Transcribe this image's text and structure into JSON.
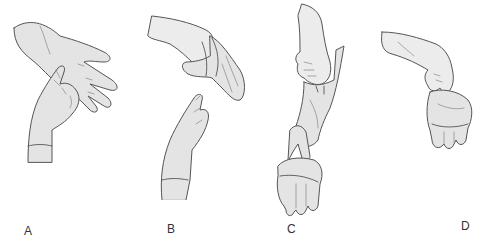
{
  "figure": {
    "panels": [
      {
        "id": "A",
        "label": "A",
        "icon": "hand-pinching-glove-palm-icon"
      },
      {
        "id": "B",
        "label": "B",
        "icon": "hand-peeling-glove-inside-out-icon"
      },
      {
        "id": "C",
        "label": "C",
        "icon": "hand-holding-removed-glove-icon"
      },
      {
        "id": "D",
        "label": "D",
        "icon": "hand-holding-balled-gloves-icon"
      }
    ]
  }
}
